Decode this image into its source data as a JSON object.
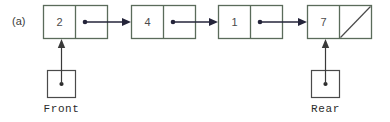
{
  "figure": {
    "panel_label": "(a)",
    "type": "linked-list-queue-diagram",
    "colors": {
      "box_border": "#5a6b5a",
      "box_fill": "#ffffff",
      "arrow": "#24243a",
      "pointer_arrow": "#3a3a3a",
      "text": "#4b4b4b",
      "label_text": "#2b2b2b",
      "background": "#ffffff"
    },
    "nodes": [
      {
        "value": "2",
        "has_next": true,
        "null_slash": false
      },
      {
        "value": "4",
        "has_next": true,
        "null_slash": false
      },
      {
        "value": "1",
        "has_next": true,
        "null_slash": false
      },
      {
        "value": "7",
        "has_next": false,
        "null_slash": true
      }
    ],
    "pointers": [
      {
        "label": "Front",
        "target_node_index": 0
      },
      {
        "label": "Rear",
        "target_node_index": 3
      }
    ]
  }
}
